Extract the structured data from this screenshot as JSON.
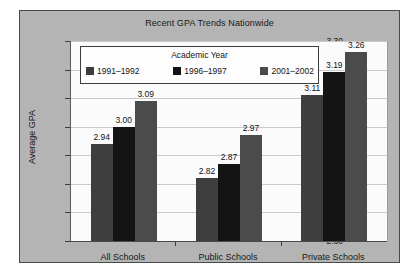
{
  "chart_data": {
    "type": "bar",
    "title": "Recent GPA Trends Nationwide",
    "xlabel": "",
    "ylabel": "Average GPA",
    "categories": [
      "All Schools",
      "Public Schools",
      "Private Schools"
    ],
    "series": [
      {
        "name": "1991–1992",
        "color": "#3e3e3e",
        "values": [
          2.94,
          2.82,
          3.11
        ]
      },
      {
        "name": "1996–1997",
        "color": "#141414",
        "values": [
          3.0,
          2.87,
          3.19
        ]
      },
      {
        "name": "2001–2002",
        "color": "#4b4b4b",
        "values": [
          3.09,
          2.97,
          3.26
        ]
      }
    ],
    "value_labels": [
      [
        "2.94",
        "3.00",
        "3.09"
      ],
      [
        "2.82",
        "2.87",
        "2.97"
      ],
      [
        "3.11",
        "3.19",
        "3.26"
      ]
    ],
    "ylim": [
      2.6,
      3.3
    ],
    "ytick_values": [
      3.3,
      3.2,
      3.1,
      3.0,
      2.9,
      2.8,
      2.7,
      2.6
    ],
    "ytick_labels": [
      "3.30",
      "3.20",
      "3.10",
      "3.00",
      "2.90",
      "2.80",
      "2.70",
      "2.60"
    ],
    "grid": true,
    "legend": {
      "title": "Academic Year",
      "position": "top-left-inside"
    },
    "colors": {
      "figure_background": "#b4b4b4",
      "plot_background": "#fbfbfb",
      "gridline": "#c9c9c9",
      "axis": "#3c3c3c",
      "text": "#161616"
    }
  }
}
